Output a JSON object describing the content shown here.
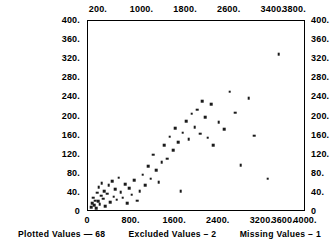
{
  "chart_data": {
    "type": "scatter",
    "title": "",
    "subtitle": "",
    "xlabel": "",
    "ylabel": "",
    "xlim": [
      0,
      4000
    ],
    "ylim": [
      0,
      400
    ],
    "grid": false,
    "legend": null,
    "marker": "square",
    "marker_color": "#1a1a1a",
    "frame_color": "#000000",
    "axis_top": {
      "ticks": [
        "200.",
        "1000.",
        "1800.",
        "2600.",
        "3400.",
        "3800."
      ],
      "values": [
        200,
        1000,
        1800,
        2600,
        3400,
        3800
      ]
    },
    "axis_bottom": {
      "ticks": [
        "0",
        "800.",
        "1600.",
        "2400.",
        "3200.",
        "3600.",
        "4000."
      ],
      "values": [
        0,
        800,
        1600,
        2400,
        3200,
        3600,
        4000
      ]
    },
    "axis_left": {
      "ticks": [
        "400.",
        "360.",
        "320.",
        "280.",
        "240.",
        "200.",
        "160.",
        "120.",
        "80.",
        "40.",
        "0"
      ],
      "values": [
        400,
        360,
        320,
        280,
        240,
        200,
        160,
        120,
        80,
        40,
        0
      ]
    },
    "axis_right": {
      "ticks": [
        "400.",
        "360.",
        "320.",
        "280.",
        "240.",
        "200.",
        "160.",
        "120.",
        "80.",
        "40.",
        "0"
      ],
      "values": [
        400,
        360,
        320,
        280,
        240,
        200,
        160,
        120,
        80,
        40,
        0
      ]
    },
    "points": [
      [
        60,
        10
      ],
      [
        75,
        18
      ],
      [
        95,
        30
      ],
      [
        110,
        14
      ],
      [
        130,
        24
      ],
      [
        150,
        8
      ],
      [
        165,
        40
      ],
      [
        185,
        22
      ],
      [
        200,
        52
      ],
      [
        215,
        16
      ],
      [
        240,
        34
      ],
      [
        255,
        60
      ],
      [
        275,
        28
      ],
      [
        300,
        44
      ],
      [
        320,
        12
      ],
      [
        350,
        38
      ],
      [
        380,
        56
      ],
      [
        410,
        20
      ],
      [
        440,
        64
      ],
      [
        470,
        32
      ],
      [
        500,
        48
      ],
      [
        530,
        26
      ],
      [
        560,
        72
      ],
      [
        600,
        42
      ],
      [
        640,
        30
      ],
      [
        680,
        58
      ],
      [
        720,
        18
      ],
      [
        760,
        50
      ],
      [
        800,
        36
      ],
      [
        850,
        66
      ],
      [
        900,
        24
      ],
      [
        950,
        44
      ],
      [
        1000,
        78
      ],
      [
        1050,
        56
      ],
      [
        1100,
        96
      ],
      [
        1150,
        70
      ],
      [
        1200,
        120
      ],
      [
        1250,
        88
      ],
      [
        1300,
        62
      ],
      [
        1350,
        104
      ],
      [
        1400,
        140
      ],
      [
        1450,
        112
      ],
      [
        1500,
        158
      ],
      [
        1560,
        130
      ],
      [
        1600,
        176
      ],
      [
        1660,
        146
      ],
      [
        1700,
        44
      ],
      [
        1740,
        166
      ],
      [
        1800,
        190
      ],
      [
        1850,
        152
      ],
      [
        1900,
        206
      ],
      [
        1960,
        178
      ],
      [
        2000,
        214
      ],
      [
        2060,
        164
      ],
      [
        2100,
        232
      ],
      [
        2150,
        198
      ],
      [
        2200,
        156
      ],
      [
        2260,
        226
      ],
      [
        2300,
        140
      ],
      [
        2400,
        188
      ],
      [
        2500,
        174
      ],
      [
        2600,
        252
      ],
      [
        2700,
        208
      ],
      [
        2800,
        98
      ],
      [
        2950,
        238
      ],
      [
        3050,
        160
      ],
      [
        3300,
        70
      ],
      [
        3500,
        330
      ]
    ],
    "n_plotted": 68,
    "n_excluded": 2,
    "n_missing": 1
  },
  "footer": {
    "plotted": "Plotted Values — 68",
    "excluded": "Excluded Values – 2",
    "missing": "Missing Values – 1"
  }
}
